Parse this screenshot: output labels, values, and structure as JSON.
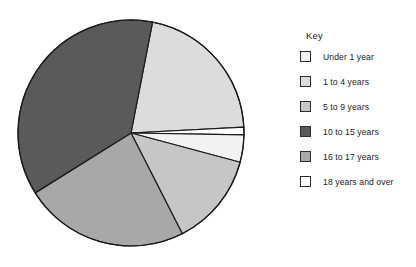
{
  "legend": {
    "title": "Key",
    "position": "right",
    "items": [
      {
        "label": "Under 1 year",
        "color": "#f2f2f2"
      },
      {
        "label": "1 to 4 years",
        "color": "#dcdcdc"
      },
      {
        "label": "5 to 9 years",
        "color": "#c6c6c6"
      },
      {
        "label": "10 to 15 years",
        "color": "#5a5a5a"
      },
      {
        "label": "16 to 17 years",
        "color": "#a8a8a8"
      },
      {
        "label": "18 years and over",
        "color": "#ffffff"
      }
    ]
  },
  "chart_data": {
    "type": "pie",
    "title": "",
    "xlabel": "",
    "ylabel": "",
    "legend_position": "right",
    "grid": false,
    "stroke_color": "#1a1a1a",
    "categories": [
      "Under 1 year",
      "1 to 4 years",
      "5 to 9 years",
      "10 to 15 years",
      "16 to 17 years",
      "18 years and over"
    ],
    "values": [
      4,
      21,
      13,
      37,
      24,
      1
    ],
    "units": "percent",
    "colors": [
      "#f2f2f2",
      "#dcdcdc",
      "#c6c6c6",
      "#5a5a5a",
      "#a8a8a8",
      "#ffffff"
    ],
    "draw_order": [
      {
        "category": "1 to 4 years",
        "color": "#dcdcdc",
        "start_angle": 11,
        "end_angle": 87
      },
      {
        "category": "18 years and over",
        "color": "#ffffff",
        "start_angle": 87,
        "end_angle": 91
      },
      {
        "category": "Under 1 year",
        "color": "#f2f2f2",
        "start_angle": 91,
        "end_angle": 105
      },
      {
        "category": "5 to 9 years",
        "color": "#c6c6c6",
        "start_angle": 105,
        "end_angle": 153
      },
      {
        "category": "16 to 17 years",
        "color": "#a8a8a8",
        "start_angle": 153,
        "end_angle": 238
      },
      {
        "category": "10 to 15 years",
        "color": "#5a5a5a",
        "start_angle": 238,
        "end_angle": 371
      }
    ],
    "geometry": {
      "cx": 123,
      "cy": 125,
      "r": 113
    }
  }
}
